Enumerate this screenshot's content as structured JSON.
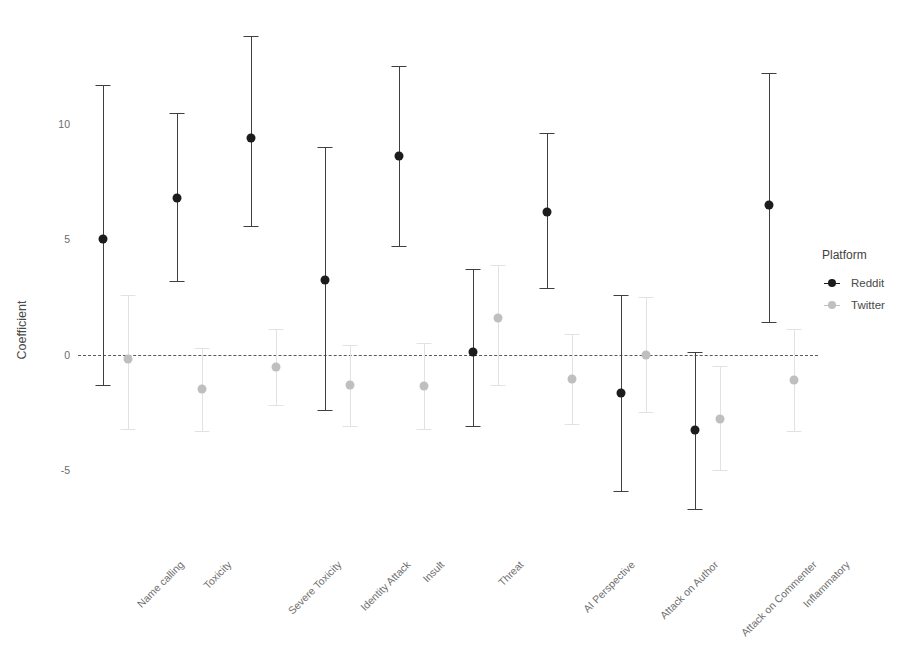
{
  "chart_data": {
    "type": "scatter",
    "title": "",
    "xlabel": "",
    "ylabel": "Coefficient",
    "ylim": [
      -7.6,
      14.6
    ],
    "yticks": [
      -5,
      0,
      5,
      10
    ],
    "ytick_labels": [
      "-5",
      "0",
      "5",
      "10"
    ],
    "grid": false,
    "zero_reference_line": 0,
    "legend": {
      "title": "Platform",
      "position": "right",
      "entries": [
        {
          "name": "Reddit",
          "color": "#1c1c1c"
        },
        {
          "name": "Twitter",
          "color": "#bfbfbf"
        }
      ]
    },
    "categories": [
      "Name calling",
      "Toxicity",
      "Severe Toxicity",
      "Identity Attack",
      "Insult",
      "Threat",
      "AI Perspective",
      "Attack on Author",
      "Attack on Commenter",
      "Inflammatory"
    ],
    "series": [
      {
        "name": "Reddit",
        "color": "#1c1c1c",
        "values": [
          5.0,
          6.8,
          9.4,
          3.25,
          8.6,
          0.1,
          6.2,
          -1.65,
          -3.25,
          6.5
        ],
        "ci_low": [
          -1.3,
          3.2,
          5.6,
          -2.4,
          4.7,
          -3.1,
          2.9,
          -5.9,
          -6.7,
          1.4
        ],
        "ci_high": [
          11.7,
          10.5,
          13.8,
          9.0,
          12.5,
          3.7,
          9.6,
          2.6,
          0.1,
          12.2
        ]
      },
      {
        "name": "Twitter",
        "color": "#bfbfbf",
        "values": [
          -0.2,
          -1.5,
          -0.55,
          -1.3,
          -1.35,
          1.6,
          -1.05,
          0.0,
          -2.8,
          -1.1
        ],
        "ci_low": [
          -3.2,
          -3.3,
          -2.2,
          -3.1,
          -3.2,
          -1.3,
          -3.0,
          -2.5,
          -5.0,
          -3.3
        ],
        "ci_high": [
          2.6,
          0.3,
          1.1,
          0.4,
          0.5,
          3.9,
          0.9,
          2.5,
          -0.5,
          1.1
        ]
      }
    ]
  }
}
